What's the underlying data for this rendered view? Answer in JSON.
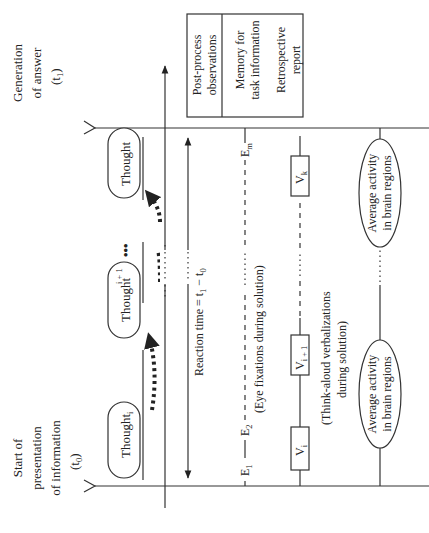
{
  "figure": {
    "orientation": "rotated -90 degrees",
    "timeline_start": {
      "line1": "Start of",
      "line2": "presentation",
      "line3": "of information",
      "time": "(t",
      "time_sub": "0",
      "time_close": ")"
    },
    "timeline_end": {
      "line1": "Generation",
      "line2": "of answer",
      "time": "(t",
      "time_sub": "1",
      "time_close": ")"
    },
    "thoughts": [
      {
        "label": "Thought",
        "sub": "i"
      },
      {
        "label": "Thought",
        "sub": "i + 1"
      },
      {
        "label": "Thought",
        "sub": "k"
      }
    ],
    "ellipsis": "•••",
    "reaction_time": {
      "label": "Reaction time = t",
      "sub1": "1",
      "minus": " − t",
      "sub0": "0"
    },
    "eye_fixations": {
      "e1": "E",
      "e1_sub": "1",
      "e2": "E",
      "e2_sub": "2",
      "em": "E",
      "em_sub": "m",
      "caption": "(Eye fixations during solution)"
    },
    "verbalizations": {
      "vi": "V",
      "vi_sub": "i",
      "vi1": "V",
      "vi1_sub": "i + 1",
      "vk": "V",
      "vk_sub": "k",
      "caption_line1": "(Think-aloud verbalizations",
      "caption_line2": "during solution)"
    },
    "brain_activity": {
      "line1": "Average activity",
      "line2": "in brain regions"
    },
    "post_process_box": {
      "header_line1": "Post-process",
      "header_line2": "observations",
      "item1_line1": "Memory for",
      "item1_line2": "task information",
      "item2_line1": "Retrospective",
      "item2_line2": "report"
    }
  }
}
